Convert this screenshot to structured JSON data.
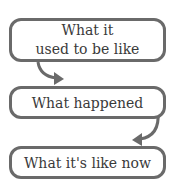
{
  "steps": [
    {
      "line1": "What it",
      "line2": "used to be like"
    },
    {
      "label": "What happened"
    },
    {
      "label": "What it's like now"
    }
  ],
  "colors": {
    "border": "#6a6a6a",
    "text": "#3a3a3a"
  }
}
